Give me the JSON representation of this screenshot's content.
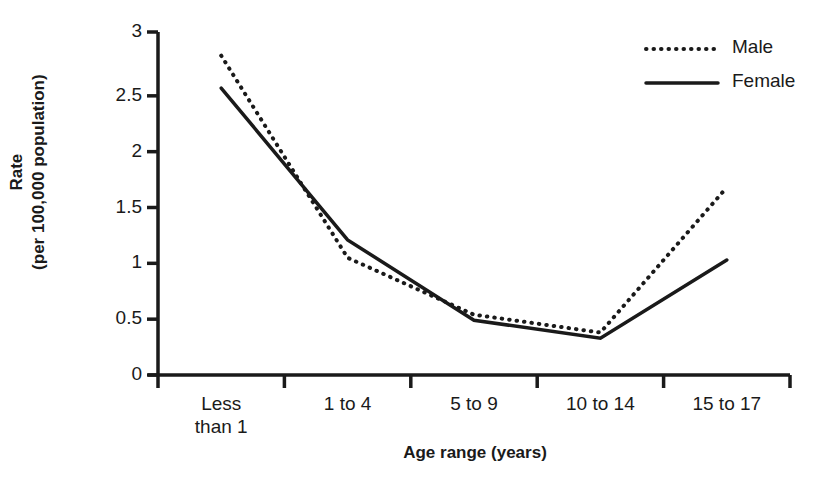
{
  "chart_data": {
    "type": "line",
    "title": "",
    "xlabel": "Age range (years)",
    "ylabel": "Rate\n(per 100,000 population)",
    "categories": [
      "Less\nthan 1",
      "1 to 4",
      "5 to 9",
      "10 to 14",
      "15 to 17"
    ],
    "ylim": [
      0,
      3
    ],
    "yticks": [
      0,
      0.5,
      1,
      1.5,
      2,
      2.5,
      3
    ],
    "ytick_labels": [
      "0",
      "0.5",
      "1",
      "1.5",
      "2",
      "2.5",
      "3"
    ],
    "grid": false,
    "legend_position": "top-right",
    "series": [
      {
        "name": "Male",
        "style": "dotted",
        "color": "#1a1a1a",
        "values": [
          2.86,
          1.05,
          0.54,
          0.38,
          1.68
        ]
      },
      {
        "name": "Female",
        "style": "solid",
        "color": "#1a1a1a",
        "values": [
          2.57,
          1.21,
          0.49,
          0.33,
          1.03
        ]
      }
    ]
  },
  "axis": {
    "y_title": "Rate\n(per 100,000 population)",
    "x_title": "Age range (years)",
    "y_tick_labels": [
      "3",
      "2.5",
      "2",
      "1.5",
      "1",
      "0.5",
      "0"
    ],
    "x_tick_labels": [
      "Less\nthan 1",
      "1 to 4",
      "5 to 9",
      "10 to 14",
      "15 to 17"
    ]
  },
  "legend": {
    "items": [
      {
        "label": "Male",
        "style": "dotted"
      },
      {
        "label": "Female",
        "style": "solid"
      }
    ]
  }
}
